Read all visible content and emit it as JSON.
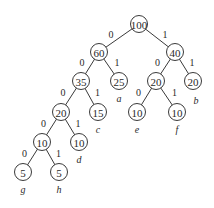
{
  "diagram": {
    "type": "huffman-tree",
    "nodes": [
      {
        "id": "n100",
        "value": "100"
      },
      {
        "id": "n60",
        "value": "60"
      },
      {
        "id": "n40",
        "value": "40"
      },
      {
        "id": "n35",
        "value": "35"
      },
      {
        "id": "n25",
        "value": "25",
        "leaf_label": "a"
      },
      {
        "id": "n20m",
        "value": "20"
      },
      {
        "id": "n20r",
        "value": "20",
        "leaf_label": "b"
      },
      {
        "id": "n20l",
        "value": "20"
      },
      {
        "id": "n15",
        "value": "15",
        "leaf_label": "c"
      },
      {
        "id": "n10e",
        "value": "10",
        "leaf_label": "e"
      },
      {
        "id": "n10f",
        "value": "10",
        "leaf_label": "f"
      },
      {
        "id": "n10l",
        "value": "10"
      },
      {
        "id": "n10d",
        "value": "10",
        "leaf_label": "d"
      },
      {
        "id": "n5g",
        "value": "5",
        "leaf_label": "g"
      },
      {
        "id": "n5h",
        "value": "5",
        "leaf_label": "h"
      }
    ],
    "edges": [
      {
        "from": "n100",
        "to": "n60",
        "label": "0"
      },
      {
        "from": "n100",
        "to": "n40",
        "label": "1"
      },
      {
        "from": "n60",
        "to": "n35",
        "label": "0"
      },
      {
        "from": "n60",
        "to": "n25",
        "label": "1"
      },
      {
        "from": "n40",
        "to": "n20m",
        "label": "0"
      },
      {
        "from": "n40",
        "to": "n20r",
        "label": "1"
      },
      {
        "from": "n35",
        "to": "n20l",
        "label": "0"
      },
      {
        "from": "n35",
        "to": "n15",
        "label": "1"
      },
      {
        "from": "n20m",
        "to": "n10e",
        "label": "0"
      },
      {
        "from": "n20m",
        "to": "n10f",
        "label": "1"
      },
      {
        "from": "n20l",
        "to": "n10l",
        "label": "0"
      },
      {
        "from": "n20l",
        "to": "n10d",
        "label": "1"
      },
      {
        "from": "n10l",
        "to": "n5g",
        "label": "0"
      },
      {
        "from": "n10l",
        "to": "n5h",
        "label": "1"
      }
    ]
  }
}
